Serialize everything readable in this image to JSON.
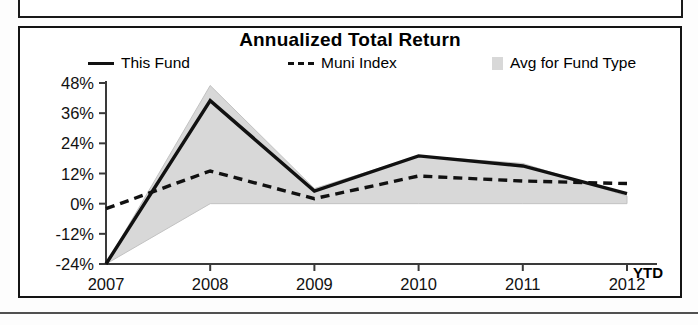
{
  "panel": {
    "title": "Annualized Total Return"
  },
  "legend": {
    "items": [
      {
        "label": "This Fund",
        "marker": "solid-line-swatch",
        "color": "#111111"
      },
      {
        "label": "Muni Index",
        "marker": "dashed-line-swatch",
        "color": "#111111"
      },
      {
        "label": "Avg for Fund Type",
        "marker": "area-swatch",
        "color": "#d8d8d8"
      }
    ]
  },
  "axis": {
    "ytd_label": "YTD"
  },
  "chart_data": {
    "type": "line",
    "title": "Annualized Total Return",
    "xlabel": "",
    "ylabel": "",
    "categories": [
      "2007",
      "2008",
      "2009",
      "2010",
      "2011",
      "2012"
    ],
    "x_tick_labels": [
      "2007",
      "2008",
      "2009",
      "2010",
      "2011",
      "2012"
    ],
    "x_axis_suffix": "YTD",
    "y_tick_labels": [
      "48%",
      "36%",
      "24%",
      "12%",
      "0%",
      "-12%",
      "-24%"
    ],
    "y_tick_values": [
      48,
      36,
      24,
      12,
      0,
      -12,
      -24
    ],
    "ylim": [
      -24,
      48
    ],
    "grid": false,
    "legend_position": "top",
    "series": [
      {
        "name": "This Fund",
        "style": "solid",
        "color": "#111111",
        "values": [
          -24,
          41,
          5,
          19,
          15,
          4
        ]
      },
      {
        "name": "Muni Index",
        "style": "dashed",
        "color": "#111111",
        "values": [
          -2,
          13,
          2,
          11,
          9,
          8
        ]
      },
      {
        "name": "Avg for Fund Type",
        "style": "band",
        "color": "#d8d8d8",
        "upper": [
          -24,
          47,
          6,
          19,
          16,
          3
        ],
        "lower": [
          -24,
          0,
          0,
          0,
          0,
          0
        ]
      }
    ]
  }
}
